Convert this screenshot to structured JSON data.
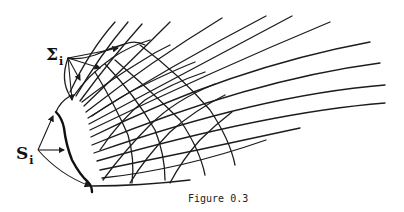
{
  "figure": {
    "caption": "Figure 0.3",
    "labels": {
      "sigma": {
        "symbol": "Σ",
        "subscript": "i"
      },
      "s": {
        "symbol": "S",
        "subscript": "i"
      }
    },
    "colors": {
      "ink": "#1c1c1c",
      "background": "#ffffff"
    }
  }
}
